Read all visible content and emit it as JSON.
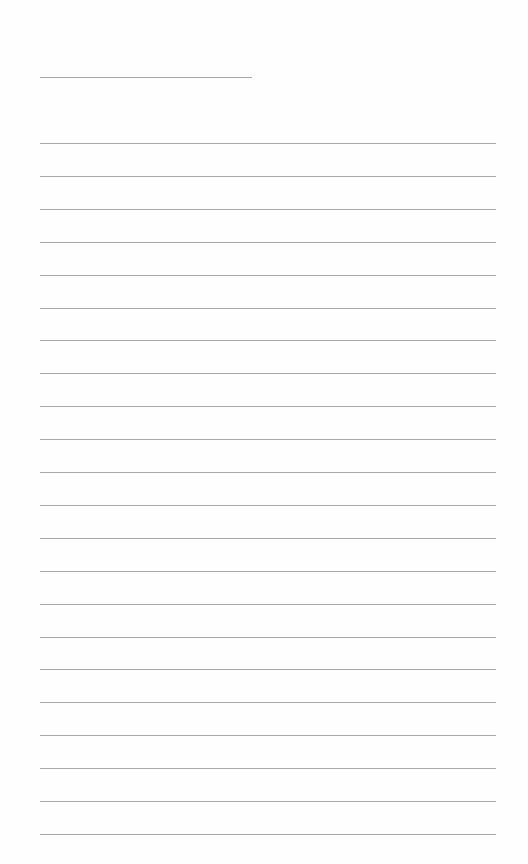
{
  "page": {
    "type": "lined-paper",
    "background": "#fefefe",
    "line_color": "#a8a8a8",
    "header_line": {
      "top": 77,
      "left": 40,
      "width": 212
    },
    "lines": {
      "count": 22,
      "first_top": 143,
      "spacing": 32.9,
      "left": 40,
      "width": 456
    }
  }
}
